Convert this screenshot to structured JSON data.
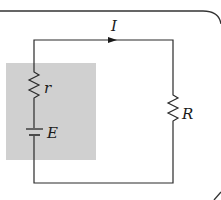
{
  "diagram": {
    "type": "circuit",
    "labels": {
      "current": "I",
      "internal_resistance": "r",
      "emf": "E",
      "load_resistance": "R"
    },
    "colors": {
      "wire": "#2a2a2a",
      "shaded_box": "#d0d0d0",
      "frame": "#333333"
    }
  }
}
